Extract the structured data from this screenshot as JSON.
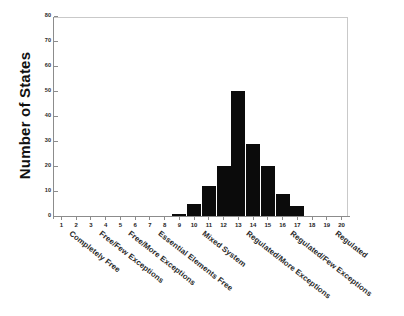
{
  "chart_data": {
    "type": "bar",
    "title": "",
    "xlabel": "",
    "ylabel": "Number of States",
    "ylim": [
      0,
      80
    ],
    "ytick_step": 10,
    "yticks": [
      0,
      10,
      20,
      30,
      40,
      50,
      60,
      70,
      80
    ],
    "xticks": [
      1,
      2,
      3,
      4,
      5,
      6,
      7,
      8,
      9,
      10,
      11,
      12,
      13,
      14,
      15,
      16,
      17,
      18,
      19,
      20
    ],
    "xlim": [
      0.5,
      20.5
    ],
    "grid": false,
    "legend": null,
    "bar_color": "#0b0b0b",
    "categories": [
      1,
      2,
      3,
      4,
      5,
      6,
      7,
      8,
      9,
      10,
      11,
      12,
      13,
      14,
      15,
      16,
      17,
      18,
      19,
      20
    ],
    "values": [
      0,
      0,
      0,
      0,
      0,
      0,
      0,
      0,
      1,
      5,
      12,
      20,
      50,
      29,
      20,
      9,
      4,
      0,
      0,
      0
    ],
    "category_labels": [
      {
        "label": "Completely Free",
        "at_tick": 2
      },
      {
        "label": "Free/Few Exceptions",
        "at_tick": 4
      },
      {
        "label": "Free/More Exceptions",
        "at_tick": 6
      },
      {
        "label": "Essential Elements Free",
        "at_tick": 8
      },
      {
        "label": "Mixed System",
        "at_tick": 11
      },
      {
        "label": "Regulated/More Exceptions",
        "at_tick": 14
      },
      {
        "label": "Regulated/Few Exceptions",
        "at_tick": 17
      },
      {
        "label": "Regulated",
        "at_tick": 20
      }
    ]
  },
  "axis": {
    "y_title": "Number of States",
    "y_tick_labels": [
      "0",
      "10",
      "20",
      "30",
      "40",
      "50",
      "60",
      "70",
      "80"
    ],
    "x_tick_labels": [
      "1",
      "2",
      "3",
      "4",
      "5",
      "6",
      "7",
      "8",
      "9",
      "10",
      "11",
      "12",
      "13",
      "14",
      "15",
      "16",
      "17",
      "18",
      "19",
      "20"
    ]
  },
  "category_text": {
    "c0": "Completely Free",
    "c1": "Free/Few Exceptions",
    "c2": "Free/More Exceptions",
    "c3": "Essential Elements Free",
    "c4": "Mixed System",
    "c5": "Regulated/More Exceptions",
    "c6": "Regulated/Few Exceptions",
    "c7": "Regulated"
  },
  "colors": {
    "bar": "#0b0b0b",
    "frame": "#c9c9c9",
    "spine": "#8c8c8c",
    "background": "#ffffff",
    "text": "#1a1a1a"
  }
}
